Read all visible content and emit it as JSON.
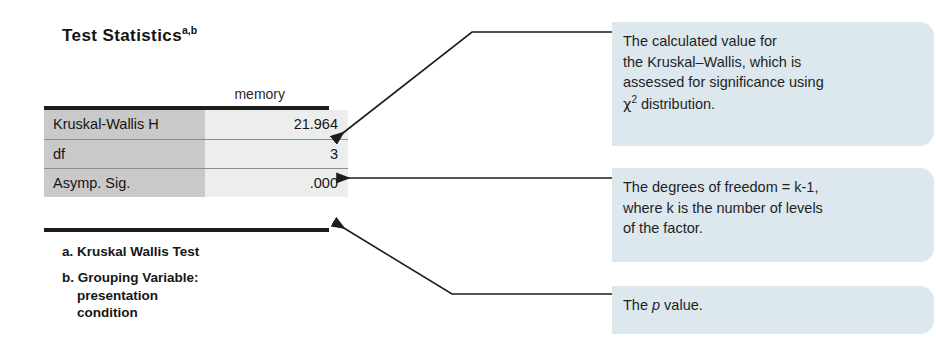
{
  "spss_output": {
    "title": "Test Statistics",
    "title_superscript": "a,b",
    "column_header": "memory",
    "rows": [
      {
        "label": "Kruskal-Wallis H",
        "value": "21.964"
      },
      {
        "label": "df",
        "value": "3"
      },
      {
        "label": "Asymp. Sig.",
        "value": ".000"
      }
    ],
    "footnotes": [
      {
        "marker": "a.",
        "text": "Kruskal Wallis Test"
      },
      {
        "marker": "b.",
        "text": "Grouping Variable:",
        "line2": "presentation",
        "line3": "condition"
      }
    ]
  },
  "annotations": [
    {
      "id": "kruskal-wallis-statistic",
      "line1": "The calculated value for",
      "line2": "the Kruskal–Wallis, which is",
      "line3": "assessed for significance using",
      "chi_symbol": "χ",
      "chi_exponent": "2",
      "line4_rest": " distribution."
    },
    {
      "id": "degrees-of-freedom",
      "line1": "The degrees of freedom = k-1,",
      "line2": "where k is the number of levels",
      "line3": "of the factor."
    },
    {
      "id": "p-value",
      "prefix": "The ",
      "italic": "p",
      "suffix": " value."
    }
  ],
  "colors": {
    "callout_background": "#dce7ee",
    "table_label_background": "#c9c9c9",
    "table_value_background": "#eceeee",
    "rule": "#1c1c1c",
    "text": "#1a1a1a"
  }
}
